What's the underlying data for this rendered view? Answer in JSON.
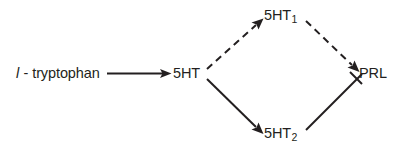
{
  "diagram": {
    "type": "pathway-flow-diagram",
    "background_color": "#ffffff",
    "stroke_color": "#231f20",
    "text_color": "#231f20",
    "nodes": [
      {
        "id": "tryptophan",
        "prefix": "l",
        "label": " - tryptophan",
        "x": 16,
        "y": 66
      },
      {
        "id": "5ht",
        "label": "5HT",
        "x": 173,
        "y": 66
      },
      {
        "id": "5ht1",
        "label": "5HT",
        "subscript": "1",
        "x": 264,
        "y": 8
      },
      {
        "id": "5ht2",
        "label": "5HT",
        "subscript": "2",
        "x": 264,
        "y": 126
      },
      {
        "id": "prl",
        "label": "PRL",
        "x": 359,
        "y": 66
      }
    ],
    "edges": [
      {
        "id": "tryptophan-to-5ht",
        "from": "tryptophan",
        "to": "5ht",
        "style": "solid",
        "arrow": "end"
      },
      {
        "id": "5ht-to-5ht1",
        "from": "5ht",
        "to": "5ht1",
        "style": "dashed",
        "arrow": "end"
      },
      {
        "id": "5ht-to-5ht2",
        "from": "5ht",
        "to": "5ht2",
        "style": "solid",
        "arrow": "end"
      },
      {
        "id": "5ht1-to-prl",
        "from": "5ht1",
        "to": "prl",
        "style": "dashed",
        "arrow": "end"
      },
      {
        "id": "5ht2-to-prl",
        "from": "5ht2",
        "to": "prl",
        "style": "solid",
        "arrow": "end"
      }
    ]
  }
}
